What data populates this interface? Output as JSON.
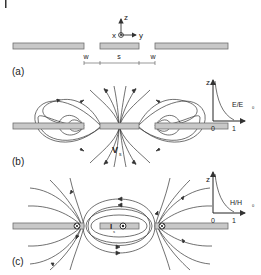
{
  "figure": {
    "colors": {
      "strip_fill": "#c8c8c8",
      "strip_stroke": "#6e6e6e",
      "line": "#333333",
      "background": "#ffffff"
    },
    "panel_a": {
      "label": "(a)",
      "axes": {
        "z": "z",
        "x": "x",
        "y": "y"
      },
      "dimensions": {
        "w_left": "w",
        "s": "s",
        "w_right": "w"
      }
    },
    "panel_b": {
      "label": "(b)",
      "source_label": "V",
      "source_sub": "s",
      "inset": {
        "y_axis": "z",
        "x_axis_main": "E/E",
        "x_axis_sub": "0",
        "tick_0": "0",
        "tick_1": "1"
      }
    },
    "panel_c": {
      "label": "(c)",
      "source_label": "I",
      "source_sub": "s",
      "inset": {
        "y_axis": "z",
        "x_axis_main": "H/H",
        "x_axis_sub": "0",
        "tick_0": "0",
        "tick_1": "1"
      }
    }
  }
}
